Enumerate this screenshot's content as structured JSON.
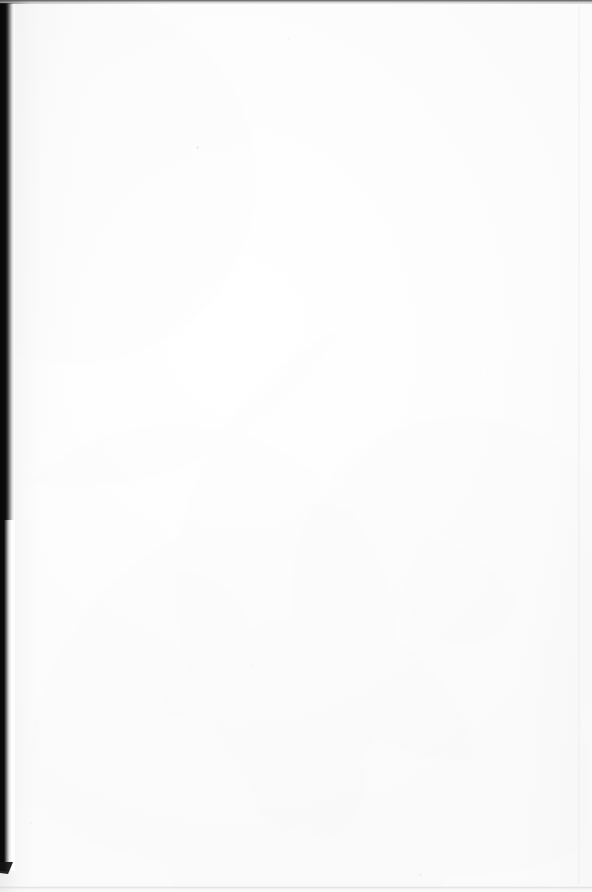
{
  "document": {
    "kind": "scanned-book-page",
    "page_state": "blank",
    "text_content": "",
    "visible_text_blocks": [],
    "page_number_label": "",
    "header_label": "",
    "footer_label": "",
    "orientation": "portrait",
    "width_px": 592,
    "height_px": 892
  },
  "colors": {
    "paper": "#ffffff",
    "paper_shade": "#fbfbfb",
    "gutter_core": "#080808",
    "gutter_mid": "#6d6d6d",
    "gutter_light": "#e4e4e4",
    "top_edge_line": "#464646",
    "bottom_edge_line": "#cecece",
    "right_edge_line": "#eaeaea",
    "speck": "#000000"
  },
  "artifacts": {
    "gutter_shadow": {
      "name": "left-binding-shadow",
      "edge": "left",
      "start_y": 3,
      "end_y": 871,
      "core_width_px": 6,
      "total_width_px": 15
    },
    "top_edge_line": {
      "name": "top-scan-edge",
      "edge": "top",
      "y": 0,
      "thickness_px": 3
    },
    "bottom_edge_line": {
      "name": "bottom-scan-edge",
      "edge": "bottom",
      "y": 886,
      "thickness_px": 2
    },
    "right_edge_line": {
      "name": "right-page-edge",
      "edge": "right",
      "x": 578,
      "thickness_px": 1
    },
    "specks": [
      {
        "name": "dust-speck",
        "x": 196,
        "y": 146
      },
      {
        "name": "dust-speck",
        "x": 419,
        "y": 874
      },
      {
        "name": "dust-speck",
        "x": 288,
        "y": 38
      },
      {
        "name": "dust-speck",
        "x": 487,
        "y": 373
      },
      {
        "name": "dust-speck",
        "x": 251,
        "y": 665
      },
      {
        "name": "dust-speck",
        "x": 30,
        "y": 822
      }
    ]
  }
}
